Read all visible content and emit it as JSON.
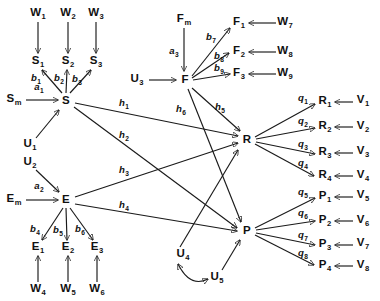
{
  "diagram": {
    "type": "path-diagram",
    "width": 380,
    "height": 301,
    "stroke_color": "#1a1a1a",
    "text_color": "#111111",
    "background": "#ffffff",
    "latent_variables": [
      {
        "id": "S",
        "base": "S",
        "sub": "",
        "x": 66,
        "y": 101
      },
      {
        "id": "E",
        "base": "E",
        "sub": "",
        "x": 66,
        "y": 200
      },
      {
        "id": "F",
        "base": "F",
        "sub": "",
        "x": 185,
        "y": 80
      },
      {
        "id": "R",
        "base": "R",
        "sub": "",
        "x": 247,
        "y": 140
      },
      {
        "id": "P",
        "base": "P",
        "sub": "",
        "x": 247,
        "y": 231
      }
    ],
    "indicator_variables": [
      {
        "id": "S1",
        "base": "S",
        "sub": "1",
        "x": 38,
        "y": 62
      },
      {
        "id": "S2",
        "base": "S",
        "sub": "2",
        "x": 68,
        "y": 62
      },
      {
        "id": "S3",
        "base": "S",
        "sub": "3",
        "x": 96,
        "y": 62
      },
      {
        "id": "E1",
        "base": "E",
        "sub": "1",
        "x": 38,
        "y": 248
      },
      {
        "id": "E2",
        "base": "E",
        "sub": "2",
        "x": 68,
        "y": 248
      },
      {
        "id": "E3",
        "base": "E",
        "sub": "3",
        "x": 97,
        "y": 248
      },
      {
        "id": "F1",
        "base": "F",
        "sub": "1",
        "x": 239,
        "y": 23
      },
      {
        "id": "F2",
        "base": "F",
        "sub": "2",
        "x": 239,
        "y": 52
      },
      {
        "id": "F3",
        "base": "F",
        "sub": "3",
        "x": 239,
        "y": 74
      },
      {
        "id": "R1",
        "base": "R",
        "sub": "1",
        "x": 325,
        "y": 102
      },
      {
        "id": "R2",
        "base": "R",
        "sub": "2",
        "x": 325,
        "y": 127
      },
      {
        "id": "R3",
        "base": "R",
        "sub": "3",
        "x": 325,
        "y": 153
      },
      {
        "id": "R4",
        "base": "R",
        "sub": "4",
        "x": 325,
        "y": 176
      },
      {
        "id": "P1",
        "base": "P",
        "sub": "1",
        "x": 325,
        "y": 197
      },
      {
        "id": "P2",
        "base": "P",
        "sub": "2",
        "x": 325,
        "y": 221
      },
      {
        "id": "P3",
        "base": "P",
        "sub": "3",
        "x": 325,
        "y": 245
      },
      {
        "id": "P4",
        "base": "P",
        "sub": "4",
        "x": 325,
        "y": 266
      }
    ],
    "exogenous_variables": [
      {
        "id": "Sm",
        "base": "S",
        "sub": "m",
        "x": 14,
        "y": 100
      },
      {
        "id": "Em",
        "base": "E",
        "sub": "m",
        "x": 14,
        "y": 200
      },
      {
        "id": "Fm",
        "base": "F",
        "sub": "m",
        "x": 184,
        "y": 20
      }
    ],
    "disturbance_variables": [
      {
        "id": "U1",
        "base": "U",
        "sub": "1",
        "x": 30,
        "y": 145
      },
      {
        "id": "U2",
        "base": "U",
        "sub": "2",
        "x": 30,
        "y": 163
      },
      {
        "id": "U3",
        "base": "U",
        "sub": "3",
        "x": 137,
        "y": 80
      },
      {
        "id": "U4",
        "base": "U",
        "sub": "4",
        "x": 183,
        "y": 255
      },
      {
        "id": "U5",
        "base": "U",
        "sub": "5",
        "x": 217,
        "y": 278
      }
    ],
    "measurement_error_variables": [
      {
        "id": "W1",
        "base": "W",
        "sub": "1",
        "x": 38,
        "y": 14
      },
      {
        "id": "W2",
        "base": "W",
        "sub": "2",
        "x": 68,
        "y": 14
      },
      {
        "id": "W3",
        "base": "W",
        "sub": "3",
        "x": 96,
        "y": 14
      },
      {
        "id": "W4",
        "base": "W",
        "sub": "4",
        "x": 38,
        "y": 290
      },
      {
        "id": "W5",
        "base": "W",
        "sub": "5",
        "x": 68,
        "y": 290
      },
      {
        "id": "W6",
        "base": "W",
        "sub": "6",
        "x": 97,
        "y": 290
      },
      {
        "id": "W7",
        "base": "W",
        "sub": "7",
        "x": 285,
        "y": 23
      },
      {
        "id": "W8",
        "base": "W",
        "sub": "8",
        "x": 285,
        "y": 52
      },
      {
        "id": "W9",
        "base": "W",
        "sub": "9",
        "x": 285,
        "y": 74
      },
      {
        "id": "V1",
        "base": "V",
        "sub": "1",
        "x": 363,
        "y": 101
      },
      {
        "id": "V2",
        "base": "V",
        "sub": "2",
        "x": 363,
        "y": 127
      },
      {
        "id": "V3",
        "base": "V",
        "sub": "3",
        "x": 363,
        "y": 152
      },
      {
        "id": "V4",
        "base": "V",
        "sub": "4",
        "x": 363,
        "y": 176
      },
      {
        "id": "V5",
        "base": "V",
        "sub": "5",
        "x": 363,
        "y": 196
      },
      {
        "id": "V6",
        "base": "V",
        "sub": "6",
        "x": 363,
        "y": 221
      },
      {
        "id": "V7",
        "base": "V",
        "sub": "7",
        "x": 363,
        "y": 244
      },
      {
        "id": "V8",
        "base": "V",
        "sub": "8",
        "x": 363,
        "y": 266
      }
    ],
    "path_coefficients": [
      {
        "id": "a1",
        "base": "a",
        "sub": "1",
        "x": 39,
        "y": 88,
        "from": "Sm",
        "to": "S"
      },
      {
        "id": "a2",
        "base": "a",
        "sub": "2",
        "x": 39,
        "y": 187,
        "from": "Em",
        "to": "E"
      },
      {
        "id": "a3",
        "base": "a",
        "sub": "3",
        "x": 174,
        "y": 52,
        "from": "Fm",
        "to": "F"
      },
      {
        "id": "b1",
        "base": "b",
        "sub": "1",
        "x": 36,
        "y": 79,
        "from": "S",
        "to": "S1"
      },
      {
        "id": "b2",
        "base": "b",
        "sub": "2",
        "x": 59,
        "y": 79,
        "from": "S",
        "to": "S2"
      },
      {
        "id": "b3",
        "base": "b",
        "sub": "3",
        "x": 77,
        "y": 80,
        "from": "S",
        "to": "S3"
      },
      {
        "id": "b4",
        "base": "b",
        "sub": "4",
        "x": 35,
        "y": 230,
        "from": "E",
        "to": "E1"
      },
      {
        "id": "b5",
        "base": "b",
        "sub": "5",
        "x": 58,
        "y": 231,
        "from": "E",
        "to": "E2"
      },
      {
        "id": "b6",
        "base": "b",
        "sub": "6",
        "x": 80,
        "y": 230,
        "from": "E",
        "to": "E3"
      },
      {
        "id": "b7",
        "base": "b",
        "sub": "7",
        "x": 211,
        "y": 38,
        "from": "F",
        "to": "F1"
      },
      {
        "id": "b8",
        "base": "b",
        "sub": "8",
        "x": 219,
        "y": 57,
        "from": "F",
        "to": "F2"
      },
      {
        "id": "b9",
        "base": "b",
        "sub": "9",
        "x": 219,
        "y": 69,
        "from": "F",
        "to": "F3"
      },
      {
        "id": "h1",
        "base": "h",
        "sub": "1",
        "x": 124,
        "y": 104,
        "from": "S",
        "to": "R"
      },
      {
        "id": "h2",
        "base": "h",
        "sub": "2",
        "x": 124,
        "y": 136,
        "from": "S",
        "to": "P"
      },
      {
        "id": "h3",
        "base": "h",
        "sub": "3",
        "x": 124,
        "y": 171,
        "from": "E",
        "to": "R"
      },
      {
        "id": "h4",
        "base": "h",
        "sub": "4",
        "x": 124,
        "y": 206,
        "from": "E",
        "to": "P"
      },
      {
        "id": "h5",
        "base": "h",
        "sub": "5",
        "x": 220,
        "y": 108,
        "from": "F",
        "to": "R"
      },
      {
        "id": "h6",
        "base": "h",
        "sub": "6",
        "x": 181,
        "y": 110,
        "from": "F",
        "to": "P"
      },
      {
        "id": "q1",
        "base": "q",
        "sub": "1",
        "x": 303,
        "y": 99,
        "from": "R",
        "to": "R1"
      },
      {
        "id": "q2",
        "base": "q",
        "sub": "2",
        "x": 303,
        "y": 122,
        "from": "R",
        "to": "R2"
      },
      {
        "id": "q3",
        "base": "q",
        "sub": "3",
        "x": 303,
        "y": 145,
        "from": "R",
        "to": "R3"
      },
      {
        "id": "q4",
        "base": "q",
        "sub": "4",
        "x": 303,
        "y": 164,
        "from": "R",
        "to": "R4"
      },
      {
        "id": "q5",
        "base": "q",
        "sub": "5",
        "x": 303,
        "y": 193,
        "from": "P",
        "to": "P1"
      },
      {
        "id": "q6",
        "base": "q",
        "sub": "6",
        "x": 303,
        "y": 214,
        "from": "P",
        "to": "P2"
      },
      {
        "id": "q7",
        "base": "q",
        "sub": "7",
        "x": 303,
        "y": 236,
        "from": "P",
        "to": "P3"
      },
      {
        "id": "q8",
        "base": "q",
        "sub": "8",
        "x": 303,
        "y": 254,
        "from": "P",
        "to": "P4"
      }
    ],
    "edges": [
      {
        "from": "W1",
        "to": "S1",
        "kind": "arrow"
      },
      {
        "from": "W2",
        "to": "S2",
        "kind": "arrow"
      },
      {
        "from": "W3",
        "to": "S3",
        "kind": "arrow"
      },
      {
        "from": "W4",
        "to": "E1",
        "kind": "arrow"
      },
      {
        "from": "W5",
        "to": "E2",
        "kind": "arrow"
      },
      {
        "from": "W6",
        "to": "E3",
        "kind": "arrow"
      },
      {
        "from": "W7",
        "to": "F1",
        "kind": "arrow"
      },
      {
        "from": "W8",
        "to": "F2",
        "kind": "arrow"
      },
      {
        "from": "W9",
        "to": "F3",
        "kind": "arrow"
      },
      {
        "from": "V1",
        "to": "R1",
        "kind": "arrow"
      },
      {
        "from": "V2",
        "to": "R2",
        "kind": "arrow"
      },
      {
        "from": "V3",
        "to": "R3",
        "kind": "arrow"
      },
      {
        "from": "V4",
        "to": "R4",
        "kind": "arrow"
      },
      {
        "from": "V5",
        "to": "P1",
        "kind": "arrow"
      },
      {
        "from": "V6",
        "to": "P2",
        "kind": "arrow"
      },
      {
        "from": "V7",
        "to": "P3",
        "kind": "arrow"
      },
      {
        "from": "V8",
        "to": "P4",
        "kind": "arrow"
      },
      {
        "from": "Sm",
        "to": "S",
        "kind": "arrow"
      },
      {
        "from": "Em",
        "to": "E",
        "kind": "arrow"
      },
      {
        "from": "Fm",
        "to": "F",
        "kind": "arrow"
      },
      {
        "from": "U1",
        "to": "S",
        "kind": "arrow"
      },
      {
        "from": "U2",
        "to": "E",
        "kind": "arrow"
      },
      {
        "from": "U3",
        "to": "F",
        "kind": "arrow"
      },
      {
        "from": "U4",
        "to": "R",
        "kind": "arrow"
      },
      {
        "from": "U5",
        "to": "P",
        "kind": "arrow"
      },
      {
        "from": "U4",
        "to": "U5",
        "kind": "double-arrow-curved"
      },
      {
        "from": "S",
        "to": "S1",
        "kind": "arrow"
      },
      {
        "from": "S",
        "to": "S2",
        "kind": "arrow"
      },
      {
        "from": "S",
        "to": "S3",
        "kind": "arrow"
      },
      {
        "from": "E",
        "to": "E1",
        "kind": "arrow"
      },
      {
        "from": "E",
        "to": "E2",
        "kind": "arrow"
      },
      {
        "from": "E",
        "to": "E3",
        "kind": "arrow"
      },
      {
        "from": "F",
        "to": "F1",
        "kind": "arrow"
      },
      {
        "from": "F",
        "to": "F2",
        "kind": "arrow"
      },
      {
        "from": "F",
        "to": "F3",
        "kind": "arrow"
      },
      {
        "from": "S",
        "to": "R",
        "kind": "arrow"
      },
      {
        "from": "S",
        "to": "P",
        "kind": "arrow"
      },
      {
        "from": "E",
        "to": "R",
        "kind": "arrow"
      },
      {
        "from": "E",
        "to": "P",
        "kind": "arrow"
      },
      {
        "from": "F",
        "to": "R",
        "kind": "arrow"
      },
      {
        "from": "F",
        "to": "P",
        "kind": "arrow"
      },
      {
        "from": "R",
        "to": "R1",
        "kind": "arrow"
      },
      {
        "from": "R",
        "to": "R2",
        "kind": "arrow"
      },
      {
        "from": "R",
        "to": "R3",
        "kind": "arrow"
      },
      {
        "from": "R",
        "to": "R4",
        "kind": "arrow"
      },
      {
        "from": "P",
        "to": "P1",
        "kind": "arrow"
      },
      {
        "from": "P",
        "to": "P2",
        "kind": "arrow"
      },
      {
        "from": "P",
        "to": "P3",
        "kind": "arrow"
      },
      {
        "from": "P",
        "to": "P4",
        "kind": "arrow"
      }
    ]
  }
}
